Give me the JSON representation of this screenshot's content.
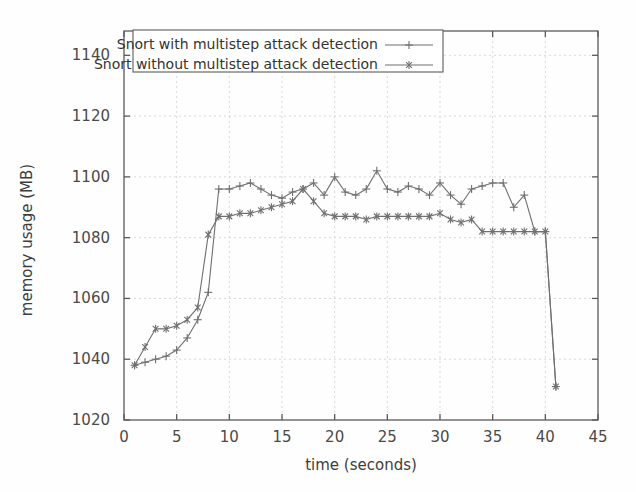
{
  "chart_data": {
    "type": "line",
    "title": "",
    "xlabel": "time (seconds)",
    "ylabel": "memory usage (MB)",
    "xlim": [
      0,
      45
    ],
    "ylim": [
      1020,
      1148
    ],
    "xticks": [
      0,
      5,
      10,
      15,
      20,
      25,
      30,
      35,
      40,
      45
    ],
    "xtick_labels": [
      "0",
      "5",
      "10",
      "15",
      "20",
      "25",
      "30",
      "35",
      "40",
      "45"
    ],
    "yticks": [
      1020,
      1040,
      1060,
      1080,
      1100,
      1120,
      1140
    ],
    "ytick_labels": [
      "1020",
      "1040",
      "1060",
      "1080",
      "1100",
      "1120",
      "1140"
    ],
    "grid": true,
    "legend_position": "top-left",
    "series": [
      {
        "name": "Snort with multistep attack detection",
        "marker": "plus",
        "color": "#6f6f6f",
        "x": [
          1,
          2,
          3,
          4,
          5,
          6,
          7,
          8,
          9,
          10,
          11,
          12,
          13,
          14,
          15,
          16,
          17,
          18,
          19,
          20,
          21,
          22,
          23,
          24,
          25,
          26,
          27,
          28,
          29,
          30,
          31,
          32,
          33,
          34,
          35,
          36,
          37,
          38,
          39,
          40,
          41
        ],
        "values": [
          1038,
          1039,
          1040,
          1041,
          1043,
          1047,
          1053,
          1062,
          1096,
          1096,
          1097,
          1098,
          1096,
          1094,
          1093,
          1095,
          1096,
          1098,
          1094,
          1100,
          1095,
          1094,
          1096,
          1102,
          1096,
          1095,
          1097,
          1096,
          1094,
          1098,
          1094,
          1091,
          1096,
          1097,
          1098,
          1098,
          1090,
          1094,
          1082,
          1082,
          1031
        ]
      },
      {
        "name": "Snort without multistep attack detection",
        "marker": "star",
        "color": "#7a7a7a",
        "x": [
          1,
          2,
          3,
          4,
          5,
          6,
          7,
          8,
          9,
          10,
          11,
          12,
          13,
          14,
          15,
          16,
          17,
          18,
          19,
          20,
          21,
          22,
          23,
          24,
          25,
          26,
          27,
          28,
          29,
          30,
          31,
          32,
          33,
          34,
          35,
          36,
          37,
          38,
          39,
          40,
          41
        ],
        "values": [
          1038,
          1044,
          1050,
          1050,
          1051,
          1053,
          1057,
          1081,
          1087,
          1087,
          1088,
          1088,
          1089,
          1090,
          1091,
          1092,
          1096,
          1092,
          1088,
          1087,
          1087,
          1087,
          1086,
          1087,
          1087,
          1087,
          1087,
          1087,
          1087,
          1088,
          1086,
          1085,
          1086,
          1082,
          1082,
          1082,
          1082,
          1082,
          1082,
          1082,
          1031
        ]
      }
    ]
  },
  "legend": {
    "entries": [
      {
        "label": "Snort with multistep attack detection",
        "marker": "plus"
      },
      {
        "label": "Snort without multistep attack detection",
        "marker": "star"
      }
    ]
  }
}
